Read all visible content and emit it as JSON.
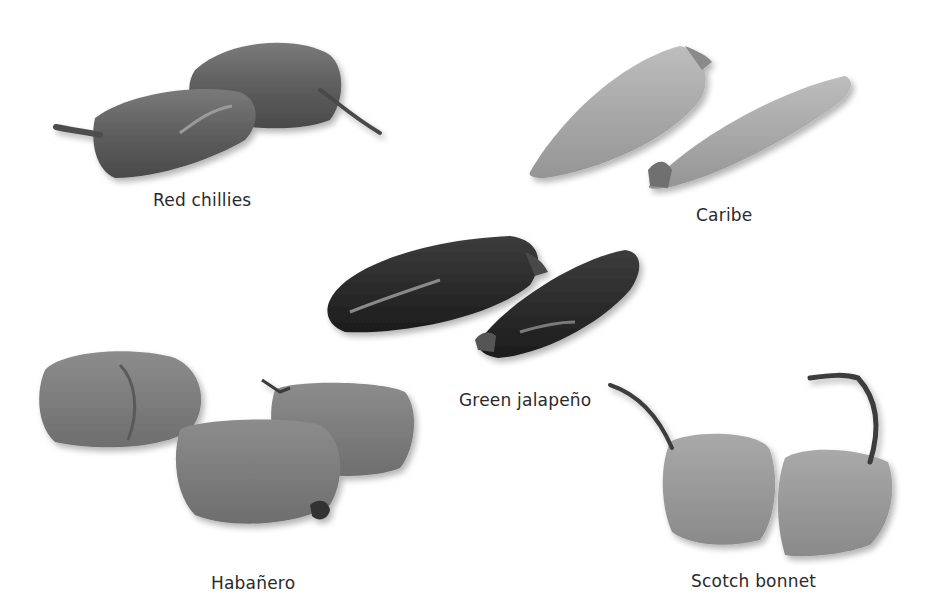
{
  "figure": {
    "background": "#ffffff",
    "peppers": [
      {
        "id": "red-chillies",
        "label": "Red chillies",
        "tone": "#6a6a6a"
      },
      {
        "id": "caribe",
        "label": "Caribe",
        "tone": "#a8a8a8"
      },
      {
        "id": "green-jalapeno",
        "label": "Green jalapeño",
        "tone": "#2e2e2e"
      },
      {
        "id": "habanero",
        "label": "Habañero",
        "tone": "#7d7d7d"
      },
      {
        "id": "scotch-bonnet",
        "label": "Scotch bonnet",
        "tone": "#9a9a9a"
      }
    ]
  }
}
